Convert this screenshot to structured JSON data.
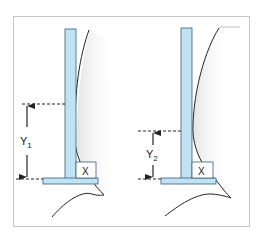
{
  "diagram": {
    "colors": {
      "frame": "#c8c8c8",
      "bar_fill": "#bfe3f5",
      "bar_stroke": "#3a5f7a",
      "line": "#222222",
      "dash": "#222222",
      "shadow": "#e6e6e6"
    },
    "panels": [
      {
        "id": "left",
        "dimension_label": "Y",
        "dimension_subscript": "1",
        "corner_label": "X"
      },
      {
        "id": "right",
        "dimension_label": "Y",
        "dimension_subscript": "2",
        "corner_label": "X"
      }
    ]
  }
}
